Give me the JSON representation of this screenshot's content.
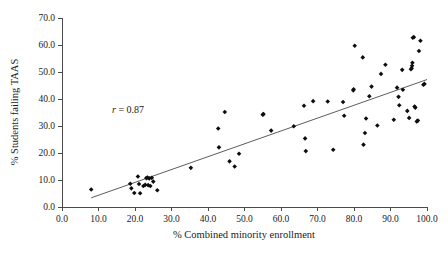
{
  "figure": {
    "background_color": "#ffffff",
    "point_color": "#0d0d0d",
    "axis_color": "#4a4a4a",
    "line_color": "#4a4a4a"
  },
  "annotation": {
    "symbol": "r",
    "equals_value": " = 0.87",
    "full_text": "r = 0.87"
  },
  "chart_data": {
    "type": "scatter",
    "title": "",
    "xlabel": "% Combined minority enrollment",
    "ylabel": "% Students failing TAAS",
    "xlim": [
      0.0,
      100.0
    ],
    "ylim": [
      0.0,
      70.0
    ],
    "xticks": [
      0.0,
      10.0,
      20.0,
      30.0,
      40.0,
      50.0,
      60.0,
      70.0,
      80.0,
      90.0,
      100.0
    ],
    "yticks": [
      0.0,
      10.0,
      20.0,
      30.0,
      40.0,
      50.0,
      60.0,
      70.0
    ],
    "xtick_labels": [
      "0.0",
      "10.0",
      "20.0",
      "30.0",
      "40.0",
      "50.0",
      "60.0",
      "70.0",
      "80.0",
      "90.0",
      "100.0"
    ],
    "ytick_labels": [
      "0.0",
      "10.0",
      "20.0",
      "30.0",
      "40.0",
      "50.0",
      "60.0",
      "70.0"
    ],
    "grid": false,
    "legend": null,
    "annotations": [
      {
        "text": "r = 0.87",
        "x": 22.0,
        "y": 36.5
      }
    ],
    "correlation_r": 0.87,
    "trendline": {
      "type": "linear-fit",
      "x_start": 8.0,
      "y_start": 3.4,
      "x_end": 100.0,
      "y_end": 47.2
    },
    "series": [
      {
        "name": "Texas school districts",
        "marker": "diamond",
        "points": [
          [
            8.0,
            6.5
          ],
          [
            18.7,
            8.6
          ],
          [
            19.0,
            6.9
          ],
          [
            19.8,
            5.2
          ],
          [
            20.8,
            11.3
          ],
          [
            21.1,
            8.5
          ],
          [
            21.4,
            5.1
          ],
          [
            22.3,
            7.8
          ],
          [
            22.8,
            8.2
          ],
          [
            23.1,
            10.7
          ],
          [
            23.4,
            10.9
          ],
          [
            23.6,
            8.1
          ],
          [
            23.9,
            10.6
          ],
          [
            24.2,
            7.8
          ],
          [
            24.6,
            10.8
          ],
          [
            25.0,
            9.4
          ],
          [
            26.1,
            6.2
          ],
          [
            35.3,
            14.5
          ],
          [
            42.8,
            29.1
          ],
          [
            43.0,
            22.1
          ],
          [
            44.6,
            35.2
          ],
          [
            45.9,
            16.9
          ],
          [
            47.3,
            15.0
          ],
          [
            48.5,
            19.7
          ],
          [
            55.0,
            34.2
          ],
          [
            55.2,
            34.4
          ],
          [
            57.3,
            28.3
          ],
          [
            63.5,
            29.9
          ],
          [
            66.3,
            37.5
          ],
          [
            66.6,
            25.4
          ],
          [
            66.8,
            20.7
          ],
          [
            68.8,
            39.2
          ],
          [
            72.8,
            39.1
          ],
          [
            74.3,
            21.2
          ],
          [
            77.0,
            38.9
          ],
          [
            77.3,
            33.8
          ],
          [
            79.8,
            43.2
          ],
          [
            79.9,
            43.6
          ],
          [
            80.2,
            59.7
          ],
          [
            82.4,
            55.4
          ],
          [
            82.6,
            23.1
          ],
          [
            83.0,
            27.4
          ],
          [
            83.3,
            32.8
          ],
          [
            84.2,
            41.0
          ],
          [
            84.8,
            44.6
          ],
          [
            86.4,
            30.2
          ],
          [
            87.4,
            49.3
          ],
          [
            88.6,
            52.7
          ],
          [
            90.9,
            32.3
          ],
          [
            91.8,
            44.2
          ],
          [
            92.2,
            40.8
          ],
          [
            92.4,
            37.7
          ],
          [
            93.2,
            50.8
          ],
          [
            93.4,
            43.4
          ],
          [
            94.6,
            35.6
          ],
          [
            95.1,
            33.0
          ],
          [
            95.6,
            51.0
          ],
          [
            95.8,
            51.4
          ],
          [
            95.9,
            52.3
          ],
          [
            96.0,
            53.4
          ],
          [
            96.1,
            62.7
          ],
          [
            96.4,
            62.9
          ],
          [
            96.6,
            37.2
          ],
          [
            96.8,
            36.8
          ],
          [
            97.2,
            31.7
          ],
          [
            97.5,
            32.0
          ],
          [
            97.8,
            57.8
          ],
          [
            98.2,
            61.6
          ],
          [
            99.0,
            45.3
          ],
          [
            99.3,
            45.6
          ]
        ]
      }
    ]
  }
}
